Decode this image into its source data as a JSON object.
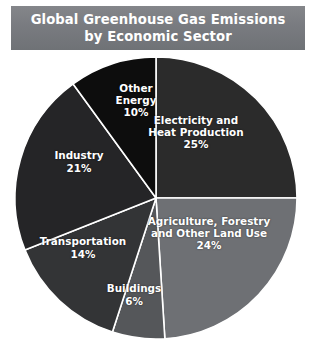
{
  "title": {
    "line1": "Global Greenhouse Gas Emissions",
    "line2": "by Economic Sector",
    "banner_color": "#797b80",
    "text_color": "#ffffff"
  },
  "chart_data": {
    "type": "pie",
    "title": "Global Greenhouse Gas Emissions by Economic Sector",
    "subtitle": "",
    "xlabel": "",
    "ylabel": "",
    "legend_position": "none",
    "grid": false,
    "value_unit": "%",
    "total": 100,
    "start_angle_deg": 0,
    "direction": "clockwise",
    "categories": [
      "Electricity and Heat Production",
      "Agriculture, Forestry and Other Land Use",
      "Buildings",
      "Transportation",
      "Industry",
      "Other Energy"
    ],
    "values": [
      25,
      24,
      6,
      14,
      21,
      10
    ],
    "labels": [
      "Electricity and\nHeat Production",
      "Agriculture, Forestry\nand Other Land Use",
      "Buildings",
      "Transportation",
      "Industry",
      "Other\nEnergy"
    ],
    "value_labels": [
      "25%",
      "24%",
      "6%",
      "14%",
      "21%",
      "10%"
    ],
    "colors": [
      "#2b2b2b",
      "#6e7074",
      "#55575a",
      "#333436",
      "#252527",
      "#0d0d0d"
    ],
    "slices": [
      {
        "name": "Electricity and Heat Production",
        "label_line1": "Electricity and",
        "label_line2": "Heat Production",
        "value": 25,
        "value_label": "25%",
        "color": "#2b2b2b",
        "label_x": 196,
        "label_y": 81
      },
      {
        "name": "Agriculture, Forestry and Other Land Use",
        "label_line1": "Agriculture, Forestry",
        "label_line2": "and Other Land Use",
        "value": 24,
        "value_label": "24%",
        "color": "#6e7074",
        "label_x": 209,
        "label_y": 182
      },
      {
        "name": "Buildings",
        "label_line1": "Buildings",
        "label_line2": "",
        "value": 6,
        "value_label": "6%",
        "color": "#55575a",
        "label_x": 134,
        "label_y": 243
      },
      {
        "name": "Transportation",
        "label_line1": "Transportation",
        "label_line2": "",
        "value": 14,
        "value_label": "14%",
        "color": "#333436",
        "label_x": 83,
        "label_y": 196
      },
      {
        "name": "Industry",
        "label_line1": "Industry",
        "label_line2": "",
        "value": 21,
        "value_label": "21%",
        "color": "#252527",
        "label_x": 79,
        "label_y": 110
      },
      {
        "name": "Other Energy",
        "label_line1": "Other",
        "label_line2": "Energy",
        "value": 10,
        "value_label": "10%",
        "color": "#0d0d0d",
        "label_x": 136,
        "label_y": 49
      }
    ],
    "geometry": {
      "cx": 156,
      "cy": 146,
      "r": 141
    }
  }
}
